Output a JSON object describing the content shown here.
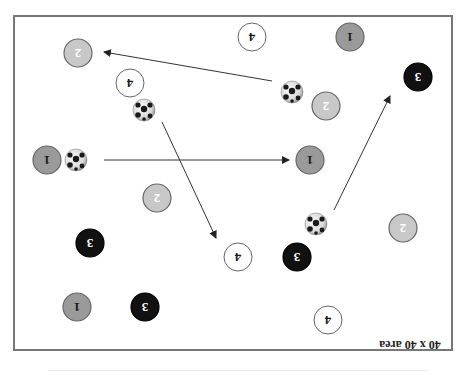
{
  "diagram": {
    "title": "40 x 40 area",
    "orientation": "rotated 180 degrees",
    "frame": {
      "x": 14,
      "y": 16,
      "width": 438,
      "height": 334,
      "stroke": "#777777"
    },
    "colors": {
      "team1": "#9a9a9a",
      "team2": "#c8c8c8",
      "team3": "#111111",
      "team4": "#ffffff",
      "outline": "#666666",
      "arrow": "#333333"
    },
    "players": [
      {
        "id": "p1",
        "number": "2",
        "team": 2,
        "x": 78,
        "y": 53
      },
      {
        "id": "p2",
        "number": "4",
        "team": 4,
        "x": 130,
        "y": 83
      },
      {
        "id": "p3",
        "number": "4",
        "team": 4,
        "x": 252,
        "y": 37
      },
      {
        "id": "p4",
        "number": "1",
        "team": 1,
        "x": 350,
        "y": 37
      },
      {
        "id": "p5",
        "number": "3",
        "team": 3,
        "x": 418,
        "y": 77
      },
      {
        "id": "p6",
        "number": "2",
        "team": 2,
        "x": 326,
        "y": 106
      },
      {
        "id": "p7",
        "number": "1",
        "team": 1,
        "x": 47,
        "y": 160
      },
      {
        "id": "p8",
        "number": "1",
        "team": 1,
        "x": 310,
        "y": 160
      },
      {
        "id": "p9",
        "number": "2",
        "team": 2,
        "x": 157,
        "y": 198
      },
      {
        "id": "p10",
        "number": "3",
        "team": 3,
        "x": 90,
        "y": 243
      },
      {
        "id": "p11",
        "number": "4",
        "team": 4,
        "x": 238,
        "y": 257
      },
      {
        "id": "p12",
        "number": "3",
        "team": 3,
        "x": 297,
        "y": 257
      },
      {
        "id": "p13",
        "number": "2",
        "team": 2,
        "x": 403,
        "y": 228
      },
      {
        "id": "p14",
        "number": "1",
        "team": 1,
        "x": 77,
        "y": 307
      },
      {
        "id": "p15",
        "number": "3",
        "team": 3,
        "x": 145,
        "y": 307
      },
      {
        "id": "p16",
        "number": "4",
        "team": 4,
        "x": 328,
        "y": 320
      }
    ],
    "balls": [
      {
        "id": "b1",
        "x": 144,
        "y": 110
      },
      {
        "id": "b2",
        "x": 292,
        "y": 92
      },
      {
        "id": "b3",
        "x": 76,
        "y": 160
      },
      {
        "id": "b4",
        "x": 316,
        "y": 224
      }
    ],
    "passes": [
      {
        "id": "a1",
        "x1": 272,
        "y1": 81,
        "x2": 104,
        "y2": 52
      },
      {
        "id": "a2",
        "x1": 104,
        "y1": 160,
        "x2": 289,
        "y2": 160
      },
      {
        "id": "a3",
        "x1": 162,
        "y1": 122,
        "x2": 216,
        "y2": 238
      },
      {
        "id": "a4",
        "x1": 334,
        "y1": 210,
        "x2": 390,
        "y2": 96
      }
    ],
    "label_position": {
      "x": 410,
      "y": 345
    }
  }
}
